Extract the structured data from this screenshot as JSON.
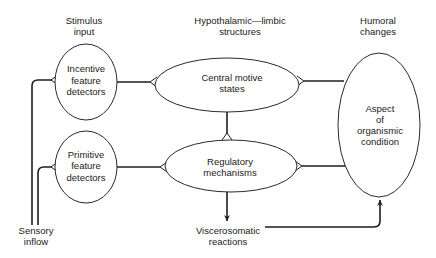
{
  "headers": {
    "stimulus": [
      "Stimulus",
      "input"
    ],
    "hypothalamic": [
      "Hypothalamic—limbic",
      "structures"
    ],
    "humoral": [
      "Humoral",
      "changes"
    ]
  },
  "nodes": {
    "incentive": [
      "Incentive",
      "feature",
      "detectors"
    ],
    "primitive": [
      "Primitive",
      "feature",
      "detectors"
    ],
    "central": [
      "Central  motive",
      "states"
    ],
    "regulatory": [
      "Regulatory",
      "mechanisms"
    ],
    "aspect": [
      "Aspect",
      "of",
      "organismic",
      "condition"
    ]
  },
  "labels": {
    "sensory": [
      "Sensory",
      "inflow"
    ],
    "viscero": [
      "Viscerosomatic",
      "reactions"
    ]
  },
  "edges": [
    {
      "from": "sensory-inflow",
      "to": "incentive-feature-detectors",
      "end": "fork"
    },
    {
      "from": "sensory-inflow",
      "to": "primitive-feature-detectors",
      "end": "fork"
    },
    {
      "from": "incentive-feature-detectors",
      "to": "central-motive-states",
      "end": "fork"
    },
    {
      "from": "primitive-feature-detectors",
      "to": "regulatory-mechanisms",
      "end": "fork"
    },
    {
      "from": "central-motive-states",
      "to": "regulatory-mechanisms",
      "end": "fork"
    },
    {
      "from": "aspect-of-organismic-condition",
      "to": "central-motive-states",
      "end": "fork"
    },
    {
      "from": "aspect-of-organismic-condition",
      "to": "regulatory-mechanisms",
      "end": "fork"
    },
    {
      "from": "regulatory-mechanisms",
      "to": "viscerosomatic-reactions",
      "end": "arrow"
    },
    {
      "from": "viscerosomatic-reactions",
      "to": "aspect-of-organismic-condition",
      "end": "arrow"
    }
  ]
}
